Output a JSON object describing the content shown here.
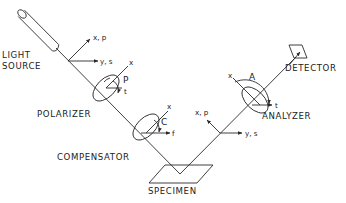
{
  "diagram": {
    "components": {
      "light_source": "LIGHT SOURCE",
      "light_source_l1": "LIGHT",
      "light_source_l2": "SOURCE",
      "polarizer": "POLARIZER",
      "compensator": "COMPENSATOR",
      "specimen": "SPECIMEN",
      "analyzer": "ANALYZER",
      "detector": "DETECTOR"
    },
    "axes": {
      "incident_xp": "x, p",
      "incident_ys": "y, s",
      "reflected_xp": "x, p",
      "reflected_ys": "y, s",
      "polarizer_x": "x",
      "polarizer_t": "t",
      "polarizer_angle": "P",
      "compensator_x": "x",
      "compensator_f": "f",
      "compensator_angle": "C",
      "analyzer_x": "x",
      "analyzer_t": "t",
      "analyzer_angle": "A"
    },
    "colors": {
      "line": "#2a2a2a",
      "background": "#ffffff"
    }
  }
}
